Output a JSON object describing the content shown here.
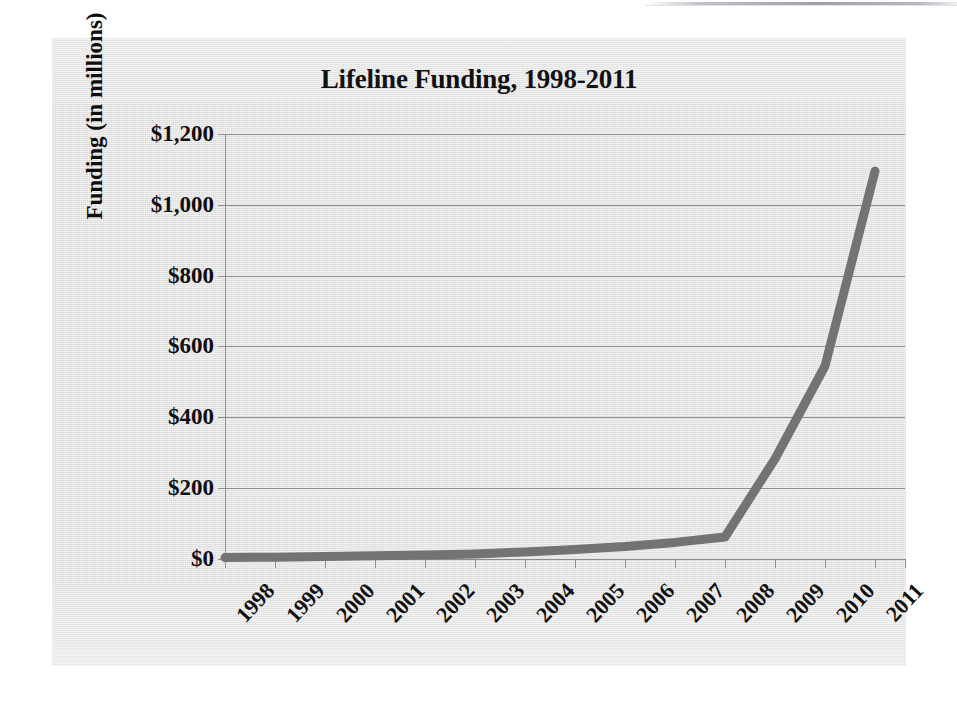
{
  "chart_data": {
    "type": "line",
    "title": "Lifeline Funding, 1998-2011",
    "xlabel": "",
    "ylabel": "Funding (in millions)",
    "categories": [
      "1998",
      "1999",
      "2000",
      "2001",
      "2002",
      "2003",
      "2004",
      "2005",
      "2006",
      "2007",
      "2008",
      "2009",
      "2010",
      "2011"
    ],
    "series": [
      {
        "name": "Lifeline Funding",
        "values": [
          4,
          5,
          7,
          9,
          11,
          14,
          20,
          27,
          35,
          47,
          62,
          283,
          545,
          1095
        ]
      }
    ],
    "ytick_labels": [
      "$0",
      "$200",
      "$400",
      "$600",
      "$800",
      "$1,000",
      "$1,200"
    ],
    "ytick_values": [
      0,
      200,
      400,
      600,
      800,
      1000,
      1200
    ],
    "ylim": [
      0,
      1200
    ],
    "grid": true,
    "legend": false,
    "legend_position": "none",
    "units": "millions of US dollars",
    "series_color": "#737373",
    "gridline_color": "#8d8d8d",
    "text_color": "#0e0e0e",
    "panel_color": "#e7e7e7",
    "x_label_rotation": -47
  }
}
